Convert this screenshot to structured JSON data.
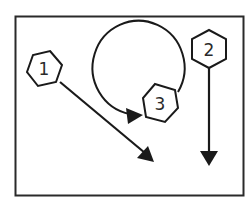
{
  "diagram": {
    "colors": {
      "stroke": "#1a1a1a",
      "background": "#ffffff"
    },
    "nodes": [
      {
        "id": 1,
        "label": "1",
        "shape": "hexagon",
        "cx": 44,
        "cy": 69,
        "r": 18,
        "arrow": "diagonal down-right"
      },
      {
        "id": 2,
        "label": "2",
        "shape": "hexagon",
        "cx": 209,
        "cy": 47,
        "r": 18,
        "arrow": "straight down"
      },
      {
        "id": 3,
        "label": "3",
        "shape": "hexagon",
        "cx": 160,
        "cy": 103,
        "r": 18,
        "arrow": "circular loop back to self"
      }
    ]
  }
}
